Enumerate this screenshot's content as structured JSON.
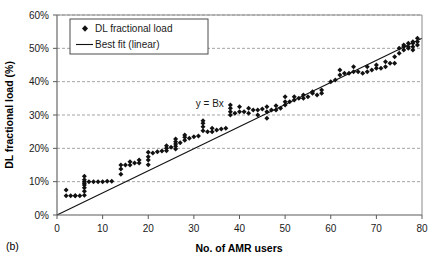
{
  "panel": {
    "label": "(b)"
  },
  "chart_data": {
    "type": "scatter",
    "title": "",
    "xlabel": "No. of AMR users",
    "ylabel": "DL fractional load (%)",
    "xlim": [
      0,
      80
    ],
    "ylim": [
      0,
      60
    ],
    "xticks": [
      0,
      10,
      20,
      30,
      40,
      50,
      60,
      70,
      80
    ],
    "xtick_labels": [
      "0",
      "10",
      "20",
      "30",
      "40",
      "50",
      "60",
      "70",
      "80"
    ],
    "yticks": [
      0,
      10,
      20,
      30,
      40,
      50,
      60
    ],
    "ytick_labels": [
      "0%",
      "10%",
      "20%",
      "30%",
      "40%",
      "50%",
      "60%"
    ],
    "grid": "horizontal-dashed",
    "legend_position": "top-left-inside",
    "legend": [
      {
        "label": "DL fractional load",
        "marker": "diamond",
        "color": "#111111"
      },
      {
        "label": "Best fit (linear)",
        "marker": "line",
        "color": "#111111"
      }
    ],
    "annotations": [
      {
        "text": "y = Bx",
        "x": 33.5,
        "y": 32.5
      }
    ],
    "series": [
      {
        "name": "DL fractional load",
        "marker": "diamond",
        "color": "#111111",
        "x": [
          2,
          2,
          3,
          4,
          4,
          5,
          6,
          6,
          6,
          6,
          6,
          6,
          6,
          6,
          7,
          8,
          9,
          10,
          11,
          12,
          14,
          14,
          14,
          15,
          16,
          16,
          17,
          18,
          18,
          20,
          20,
          20,
          20,
          21,
          22,
          23,
          24,
          24,
          24,
          25,
          26,
          26,
          26,
          26,
          26,
          27,
          28,
          28,
          28,
          29,
          30,
          31,
          32,
          32,
          32,
          32,
          33,
          34,
          34,
          35,
          36,
          37,
          38,
          38,
          38,
          38,
          39,
          40,
          40,
          41,
          42,
          42,
          43,
          44,
          44,
          45,
          46,
          46,
          46,
          47,
          48,
          48,
          49,
          50,
          50,
          50,
          51,
          52,
          52,
          53,
          54,
          54,
          55,
          56,
          56,
          57,
          58,
          58,
          60,
          61,
          62,
          62,
          63,
          64,
          65,
          65,
          66,
          67,
          68,
          68,
          69,
          70,
          70,
          71,
          72,
          72,
          73,
          74,
          74,
          75,
          75,
          76,
          76,
          76,
          77,
          77,
          77,
          78,
          78,
          78,
          78,
          79,
          79,
          79
        ],
        "y": [
          7.5,
          5.8,
          5.8,
          5.8,
          5.8,
          5.8,
          5.9,
          7.1,
          8.2,
          9.0,
          9.5,
          10.0,
          10.6,
          11.6,
          10.0,
          10.0,
          10.0,
          10.0,
          10.1,
          10.1,
          12.2,
          13.8,
          15.0,
          15.0,
          15.0,
          16.0,
          15.6,
          15.6,
          16.5,
          15.1,
          16.5,
          17.5,
          18.8,
          18.6,
          19.0,
          19.2,
          19.3,
          20.0,
          20.8,
          20.3,
          19.8,
          20.6,
          21.3,
          22.0,
          22.8,
          21.7,
          22.4,
          23.3,
          24.0,
          23.0,
          23.5,
          23.7,
          25.3,
          26.5,
          27.5,
          28.3,
          25.0,
          25.0,
          26.0,
          25.5,
          25.8,
          26.0,
          30.0,
          31.0,
          32.0,
          33.0,
          30.5,
          31.0,
          32.5,
          31.0,
          30.5,
          32.0,
          31.5,
          30.0,
          31.5,
          31.8,
          29.0,
          31.0,
          32.5,
          31.5,
          31.5,
          32.8,
          32.0,
          33.0,
          34.0,
          35.5,
          34.0,
          34.5,
          35.5,
          35.0,
          35.0,
          36.0,
          35.5,
          36.5,
          37.0,
          36.0,
          36.5,
          37.5,
          40.0,
          40.5,
          42.0,
          43.5,
          42.5,
          42.5,
          43.0,
          44.5,
          43.0,
          42.5,
          43.0,
          44.5,
          43.5,
          44.0,
          45.0,
          44.0,
          44.5,
          46.0,
          45.5,
          45.5,
          47.5,
          48.5,
          50.0,
          49.5,
          50.5,
          51.0,
          50.0,
          50.5,
          51.5,
          49.5,
          50.5,
          51.5,
          52.0,
          51.0,
          52.0,
          53.0
        ]
      }
    ],
    "bestfit": {
      "name": "Best fit (linear)",
      "slope": 0.66,
      "intercept": 0,
      "x_start": 0,
      "x_end": 80,
      "y_start": 0,
      "y_end": 53.0
    }
  }
}
